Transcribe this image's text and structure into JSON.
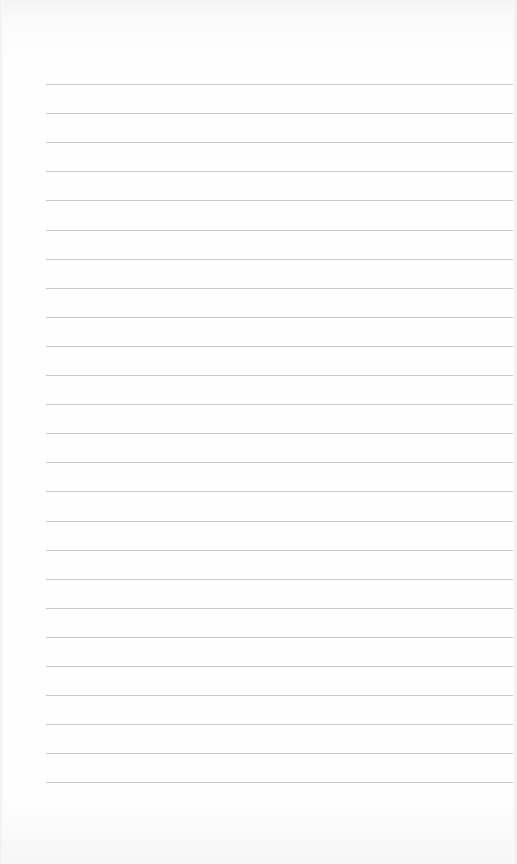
{
  "page": {
    "type": "blank lined paper",
    "background_color": "#fdfdfd",
    "line_color": "#c9c9c9"
  },
  "ruling": {
    "line_count": 25,
    "first_line_y": 84,
    "line_spacing": 29.1,
    "left_x": 46,
    "right_x": 513
  }
}
